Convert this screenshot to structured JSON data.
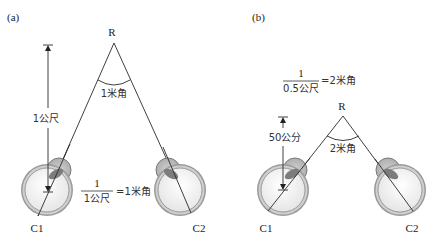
{
  "panels": [
    {
      "label": "(a)",
      "apex_label": "R",
      "angle_label": "1米角",
      "distance_label": "1公尺",
      "formula": {
        "numerator": "1",
        "denominator": "1公尺",
        "result": "=1米角"
      },
      "left_eye_label": "C1",
      "right_eye_label": "C2"
    },
    {
      "label": "(b)",
      "apex_label": "R",
      "angle_label": "2米角",
      "distance_label": "50公分",
      "formula": {
        "numerator": "1",
        "denominator": "0.5公尺",
        "result": "=2米角"
      },
      "left_eye_label": "C1",
      "right_eye_label": "C2"
    }
  ],
  "colors": {
    "eye_ring": "#8a8a8a",
    "eye_fill": "#f4f4f4",
    "lens": "#9a9a9a",
    "line": "#2a2a2a"
  }
}
